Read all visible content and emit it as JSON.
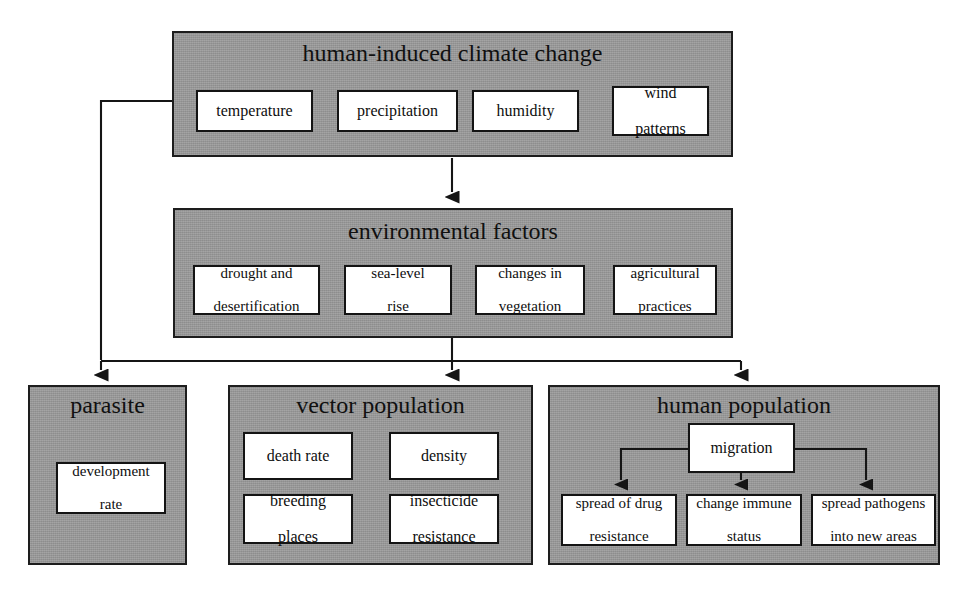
{
  "diagram": {
    "type": "flowchart",
    "groups": [
      {
        "id": "climate",
        "label": "human-induced climate change",
        "items": [
          {
            "label": "temperature"
          },
          {
            "label": "precipitation"
          },
          {
            "label": "humidity"
          },
          {
            "label": "wind patterns",
            "line1": "wind",
            "line2": "patterns"
          }
        ]
      },
      {
        "id": "environment",
        "label": "environmental factors",
        "items": [
          {
            "label": "drought and desertification",
            "line1": "drought and",
            "line2": "desertification"
          },
          {
            "label": "sea-level rise",
            "line1": "sea-level",
            "line2": "rise"
          },
          {
            "label": "changes in vegetation",
            "line1": "changes in",
            "line2": "vegetation"
          },
          {
            "label": "agricultural practices",
            "line1": "agricultural",
            "line2": "practices"
          }
        ]
      },
      {
        "id": "parasite",
        "label": "parasite",
        "items": [
          {
            "label": "development rate",
            "line1": "development",
            "line2": "rate"
          }
        ]
      },
      {
        "id": "vector",
        "label": "vector population",
        "items": [
          {
            "label": "death rate"
          },
          {
            "label": "density"
          },
          {
            "label": "breeding places",
            "line1": "breeding",
            "line2": "places"
          },
          {
            "label": "insecticide resistance",
            "line1": "insecticide",
            "line2": "resistance"
          }
        ]
      },
      {
        "id": "human",
        "label": "human population",
        "items": [
          {
            "label": "migration"
          },
          {
            "label": "spread of drug resistance",
            "line1": "spread of drug",
            "line2": "resistance"
          },
          {
            "label": "change immune status",
            "line1": "change immune",
            "line2": "status"
          },
          {
            "label": "spread pathogens into new areas",
            "line1": "spread pathogens",
            "line2": "into new areas"
          }
        ]
      }
    ],
    "edges": [
      {
        "from": "human-induced climate change",
        "to": "environmental factors"
      },
      {
        "from": "environmental factors",
        "to": "parasite"
      },
      {
        "from": "environmental factors",
        "to": "vector population"
      },
      {
        "from": "environmental factors",
        "to": "human population"
      },
      {
        "from": "temperature",
        "to": "parasite"
      },
      {
        "from": "migration",
        "to": "spread of drug resistance"
      },
      {
        "from": "migration",
        "to": "change immune status"
      },
      {
        "from": "migration",
        "to": "spread pathogens into new areas"
      }
    ],
    "colors": {
      "panel_fill": "#9a9a9a",
      "panel_border": "#1d1d1d",
      "leaf_fill": "#ffffff",
      "leaf_border": "#141414",
      "line": "#151515",
      "page_background": "#ffffff"
    }
  }
}
